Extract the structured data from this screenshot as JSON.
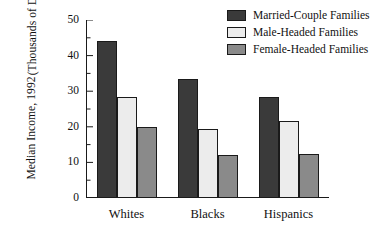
{
  "chart_data": {
    "type": "bar",
    "title": "",
    "xlabel": "",
    "ylabel_line1": "Median Income, 1992",
    "ylabel_line2": "(Thousands of Dollars)",
    "categories": [
      "Whites",
      "Blacks",
      "Hispanics"
    ],
    "series": [
      {
        "name": "Married-Couple Families",
        "color": "#3a3a3a",
        "values": [
          44,
          33.5,
          28.5
        ]
      },
      {
        "name": "Male-Headed Families",
        "color": "#ececec",
        "values": [
          28.5,
          19.5,
          21.5
        ]
      },
      {
        "name": "Female-Headed Families",
        "color": "#8a8a8a",
        "values": [
          20,
          12,
          12.3
        ]
      }
    ],
    "ylim": [
      0,
      50
    ],
    "yticks": [
      0,
      10,
      20,
      30,
      40,
      50
    ],
    "ytick_labels": [
      "0",
      "10",
      "20",
      "30",
      "40",
      "50"
    ],
    "minor_yticks": [
      5,
      15,
      25,
      35,
      45
    ],
    "grid": false,
    "legend_position": "top-right",
    "axis_color": "#1a1a1a"
  }
}
